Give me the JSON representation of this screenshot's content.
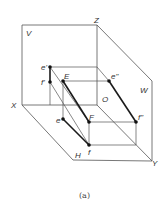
{
  "diagram": {
    "caption": "(a)",
    "planes": {
      "V": "V",
      "W": "W",
      "H": "H"
    },
    "axes": {
      "X": "X",
      "Y": "Y",
      "Z": "Z",
      "O": "O"
    },
    "points": {
      "e_prime": "e'",
      "f_prime": "f'",
      "E": "E",
      "e_double_prime": "e\"",
      "F": "F",
      "f_double_prime": "f\"",
      "e": "e",
      "f": "f"
    },
    "colors": {
      "line": "#444444",
      "thick": "#1a1a1a",
      "point": "#111111"
    }
  }
}
